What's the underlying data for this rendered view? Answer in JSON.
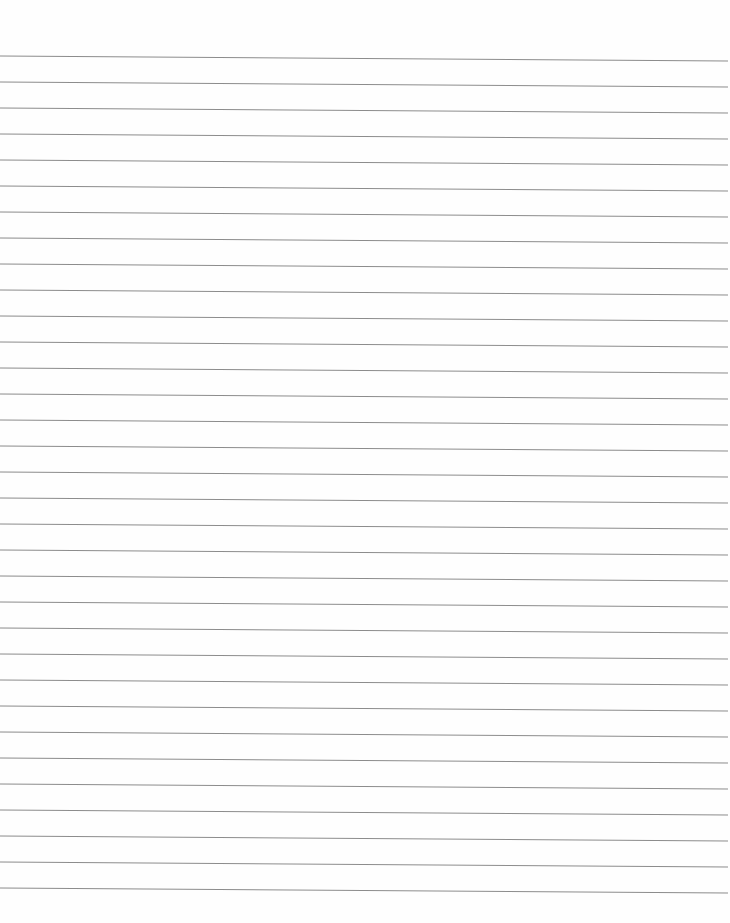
{
  "paper": {
    "background_color": "#fefefe",
    "rule_color": "#8c8c8c",
    "rule_count": 33,
    "first_rule_y_left": 56,
    "first_rule_y_right": 61,
    "rule_spacing": 26,
    "rule_width_px": 1.1
  }
}
